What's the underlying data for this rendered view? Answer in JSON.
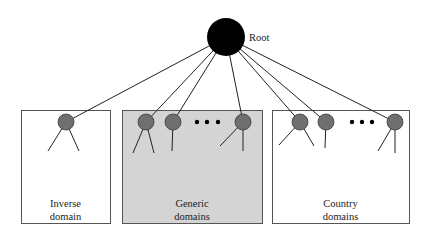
{
  "diagram": {
    "root": {
      "label": "Root",
      "cx": 226,
      "cy": 37,
      "r": 19,
      "color": "#000000"
    },
    "node_color": "#6f6f6f",
    "node_stroke": "#3a3a3a",
    "domains": [
      {
        "id": "inverse",
        "label_line1": "Inverse",
        "label_line2": "domain",
        "box": {
          "x": 21,
          "y": 110,
          "w": 89,
          "h": 113,
          "fill": "#ffffff"
        },
        "nodes": [
          {
            "cx": 66,
            "cy": 122,
            "children": [
              [
                48,
                151
              ],
              [
                79,
                151
              ]
            ]
          }
        ],
        "ellipsis": null
      },
      {
        "id": "generic",
        "label_line1": "Generic",
        "label_line2": "domains",
        "box": {
          "x": 122,
          "y": 110,
          "w": 140,
          "h": 113,
          "fill": "#d4d4d4"
        },
        "nodes": [
          {
            "cx": 146,
            "cy": 122,
            "children": [
              [
                133,
                153
              ],
              [
                154,
                153
              ]
            ]
          },
          {
            "cx": 173,
            "cy": 122,
            "children": [
              [
                172,
                151
              ]
            ]
          },
          {
            "cx": 243,
            "cy": 122,
            "children": [
              [
                220,
                146
              ],
              [
                243,
                151
              ]
            ]
          }
        ],
        "ellipsis": {
          "x": [
            197,
            207,
            218
          ],
          "y": 122
        }
      },
      {
        "id": "country",
        "label_line1": "Country",
        "label_line2": "domains",
        "box": {
          "x": 272,
          "y": 110,
          "w": 137,
          "h": 113,
          "fill": "#ffffff"
        },
        "nodes": [
          {
            "cx": 300,
            "cy": 122,
            "children": [
              [
                279,
                145
              ],
              [
                314,
                146
              ]
            ]
          },
          {
            "cx": 326,
            "cy": 122,
            "children": [
              [
                325,
                148
              ]
            ]
          },
          {
            "cx": 395,
            "cy": 122,
            "children": [
              [
                378,
                151
              ],
              [
                395,
                153
              ]
            ]
          }
        ],
        "ellipsis": {
          "x": [
            352,
            362,
            372
          ],
          "y": 122
        }
      }
    ]
  }
}
